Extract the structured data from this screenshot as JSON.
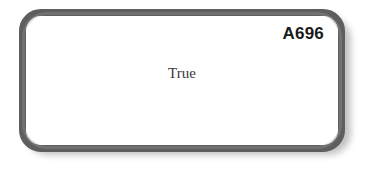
{
  "card": {
    "id_label": "A696",
    "body_text": "True",
    "border_color": "#5e5e5e",
    "background_color": "#ffffff",
    "id_text_color": "#1a1a1a",
    "body_text_color": "#3a3a3a"
  },
  "canvas": {
    "background_color": "#ffffff"
  }
}
